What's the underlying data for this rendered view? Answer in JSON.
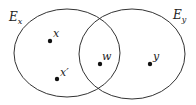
{
  "diagram": {
    "type": "venn",
    "stroke_color": "#333333",
    "sets": [
      {
        "id": "Ex",
        "label_main": "E",
        "label_sub": "x"
      },
      {
        "id": "Ey",
        "label_main": "E",
        "label_sub": "y"
      }
    ],
    "points": [
      {
        "id": "x",
        "label": "x",
        "region": "Ex only"
      },
      {
        "id": "xprime",
        "label": "x′",
        "region": "Ex only"
      },
      {
        "id": "w",
        "label": "w",
        "region": "Ex ∩ Ey"
      },
      {
        "id": "y",
        "label": "y",
        "region": "Ey only"
      }
    ]
  }
}
